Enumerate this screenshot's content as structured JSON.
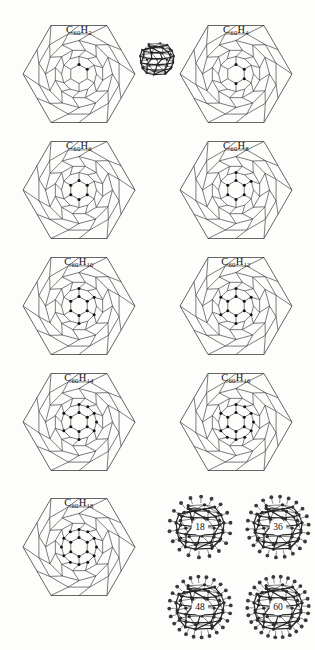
{
  "figure": {
    "background_color": "#fdfdfc",
    "ink_color": "#2b2b2b",
    "marker_color": "#111111"
  },
  "schlegel_panels": [
    {
      "name": "c60h2",
      "formula_c": "C",
      "sub1": "60",
      "formula_h": "H",
      "sub2": "2",
      "label": "C60H2",
      "hydrogen_count": 2,
      "column": 0,
      "row": 0
    },
    {
      "name": "c60h4",
      "formula_c": "C",
      "sub1": "60",
      "formula_h": "H",
      "sub2": "4",
      "label": "C60H4",
      "hydrogen_count": 4,
      "column": 1,
      "row": 0
    },
    {
      "name": "c60h6",
      "formula_c": "C",
      "sub1": "60",
      "formula_h": "H",
      "sub2": "6",
      "label": "C60H6",
      "hydrogen_count": 6,
      "column": 0,
      "row": 1
    },
    {
      "name": "c60h8",
      "formula_c": "C",
      "sub1": "60",
      "formula_h": "H",
      "sub2": "8",
      "label": "C60H8",
      "hydrogen_count": 8,
      "column": 1,
      "row": 1
    },
    {
      "name": "c60h10",
      "formula_c": "C",
      "sub1": "60",
      "formula_h": "H",
      "sub2": "10",
      "label": "C60H10",
      "hydrogen_count": 10,
      "column": 0,
      "row": 2
    },
    {
      "name": "c60h12",
      "formula_c": "C",
      "sub1": "60",
      "formula_h": "H",
      "sub2": "12",
      "label": "C60H12",
      "hydrogen_count": 12,
      "column": 1,
      "row": 2
    },
    {
      "name": "c60h14",
      "formula_c": "C",
      "sub1": "60",
      "formula_h": "H",
      "sub2": "14",
      "label": "C60H14",
      "hydrogen_count": 14,
      "column": 0,
      "row": 3
    },
    {
      "name": "c60h16",
      "formula_c": "C",
      "sub1": "60",
      "formula_h": "H",
      "sub2": "16",
      "label": "C60H16",
      "hydrogen_count": 16,
      "column": 1,
      "row": 3
    },
    {
      "name": "c60h18",
      "formula_c": "C",
      "sub1": "60",
      "formula_h": "H",
      "sub2": "18",
      "label": "C60H18",
      "hydrogen_count": 18,
      "column": 0,
      "row": 4
    }
  ],
  "center_ball": {
    "name": "c60-cage",
    "description": "ball-and-stick C60 buckminsterfullerene"
  },
  "cage_cluster": [
    {
      "name": "cage-18",
      "number": "18",
      "column": 0,
      "row": 0
    },
    {
      "name": "cage-36",
      "number": "36",
      "column": 1,
      "row": 0
    },
    {
      "name": "cage-48",
      "number": "48",
      "column": 0,
      "row": 1
    },
    {
      "name": "cage-60",
      "number": "60",
      "column": 1,
      "row": 1
    }
  ]
}
